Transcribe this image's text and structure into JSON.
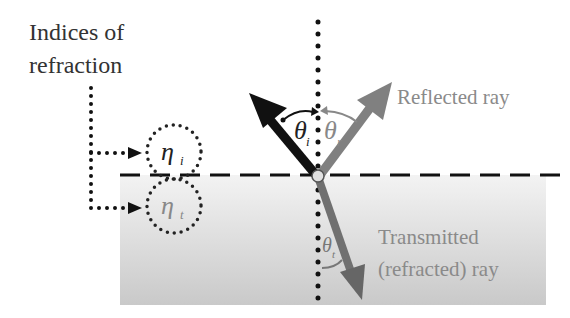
{
  "title_label": {
    "line1": "Indices of",
    "line2": "refraction"
  },
  "labels": {
    "reflected": "Reflected ray",
    "transmitted_line1": "Transmitted",
    "transmitted_line2": "(refracted) ray"
  },
  "symbols": {
    "eta_i": "η",
    "eta_i_sub": "i",
    "eta_t": "η",
    "eta_t_sub": "t",
    "theta_i": "θ",
    "theta_i_sub": "i",
    "theta_r": "θ",
    "theta_r_sub": "r",
    "theta_t": "θ",
    "theta_t_sub": "t"
  },
  "colors": {
    "incident": "#111111",
    "reflected": "#808080",
    "transmitted": "#707070",
    "medium": "#d9d9d9",
    "text_dark": "#333333",
    "text_gray": "#8a8a8a"
  }
}
